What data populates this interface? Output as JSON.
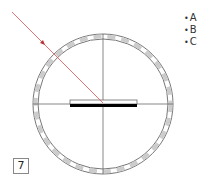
{
  "diagram": {
    "type": "optics-ray-mirror",
    "ray_color": "#e05050",
    "mirror_color": "#000000",
    "legend": [
      "A",
      "B",
      "C"
    ],
    "label": "7"
  }
}
